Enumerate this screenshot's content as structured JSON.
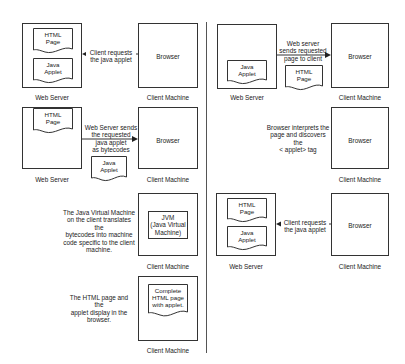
{
  "left": {
    "step1": {
      "server_box": {
        "label": "Web Server",
        "docs": [
          "HTML\nPage",
          "Java\nApplet"
        ]
      },
      "client_box": {
        "label": "Client Machine",
        "content": "Browser"
      },
      "arrow": {
        "direction": "left",
        "text": "Client requests\nthe java applet"
      }
    },
    "step2": {
      "server_box": {
        "label": "Web Server",
        "docs": [
          "HTML\nPage"
        ]
      },
      "client_box": {
        "label": "Client Machine",
        "content": "Browser"
      },
      "arrow": {
        "direction": "right",
        "text": "Web Server sends\nthe requested\njava applet\nas bytecodes"
      },
      "moving_doc": "Java\nApplet"
    },
    "step3": {
      "description": "The Java Virtual Machine\non the client translates the\nbytecodes into machine\ncode specific to the client\nmachine.",
      "client_box": {
        "label": "Client Machine",
        "inner": "JVM\n(Java Virtual\nMachine)"
      }
    },
    "step4": {
      "description": "The HTML page and the\napplet display in the\nbrowser.",
      "client_box": {
        "label": "Client Machine",
        "doc": "Complete\nHTML page\nwith applet."
      }
    }
  },
  "right": {
    "step1": {
      "server_box": {
        "label": "Web Server",
        "docs": [
          "Java\nApplet"
        ]
      },
      "client_box": {
        "label": "Client Machine",
        "content": "Browser"
      },
      "arrow": {
        "direction": "right",
        "text": "Web server\nsends requested\npage to client"
      },
      "moving_doc": "HTML\nPage"
    },
    "step2": {
      "description": "Browser interprets the\npage and discovers the\n< applet> tag",
      "client_box": {
        "label": "Client Machine",
        "content": "Browser"
      }
    },
    "step3": {
      "server_box": {
        "label": "Web Server",
        "docs": [
          "HTML\nPage",
          "Java\nApplet"
        ]
      },
      "client_box": {
        "label": "Client Machine",
        "content": "Browser"
      },
      "arrow": {
        "direction": "left",
        "text": "Client requests\nthe java applet"
      }
    }
  },
  "colors": {
    "stroke": "#333333",
    "text": "#222222",
    "divider": "#555555"
  }
}
